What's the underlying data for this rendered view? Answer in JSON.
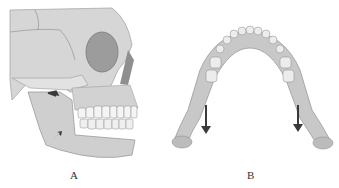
{
  "figure": {
    "panels": [
      {
        "label": "A",
        "description": "Lateral view of skull with arrows on mandible ramus",
        "arrows": 2,
        "bone_color": "#d9d9d9",
        "shadow_color": "#9a9a9a",
        "arrow_color": "#3a3a3a"
      },
      {
        "label": "B",
        "description": "Superior view of mandible with downward arrows at rami",
        "arrows": 2,
        "bone_color": "#c8c8c8",
        "arrow_color": "#3a3a3a"
      }
    ]
  }
}
